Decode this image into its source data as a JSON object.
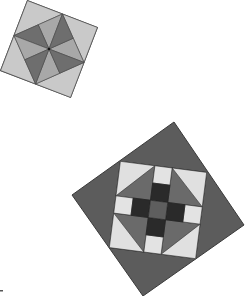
{
  "image": {
    "width": 247,
    "height": 296,
    "background": "#ffffff",
    "description": "Two rotated quilt block squares on white background"
  },
  "colors": {
    "light": "#d9d9d9",
    "lighter": "#e6e6e6",
    "medium": "#a6a6a6",
    "mediumdark": "#8c8c8c",
    "dark": "#595959",
    "darker": "#3a3a3a",
    "darkest": "#262626",
    "outline": "#4a4a4a",
    "frame": "#5a5a5a"
  },
  "blocks": [
    {
      "name": "pinwheel-block",
      "center": [
        49,
        49
      ],
      "side": 75,
      "rotation_deg": 21
    },
    {
      "name": "shoofly-block",
      "center": [
        158,
        209
      ],
      "side": 124,
      "rotation_deg": 55.8,
      "inner": {
        "center": [
          158,
          210
        ],
        "side": 87,
        "rotation_deg": 7.3
      }
    }
  ]
}
